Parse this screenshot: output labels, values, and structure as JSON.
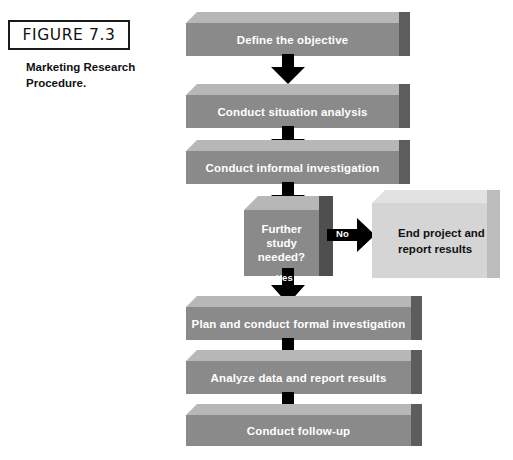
{
  "figure": {
    "label": "FIGURE 7.3",
    "caption": "Marketing Research Procedure."
  },
  "flowchart": {
    "title": "Marketing Research Procedure",
    "steps": [
      {
        "id": "step-1",
        "text": "Define the objective",
        "shape": "bar"
      },
      {
        "id": "step-2",
        "text": "Conduct situation analysis",
        "shape": "bar"
      },
      {
        "id": "step-3",
        "text": "Conduct informal investigation",
        "shape": "bar"
      },
      {
        "id": "step-4",
        "text": "Further study needed?",
        "shape": "decision"
      },
      {
        "id": "step-5",
        "text": "Plan and conduct formal investigation",
        "shape": "bar"
      },
      {
        "id": "step-6",
        "text": "Analyze data and report results",
        "shape": "bar"
      },
      {
        "id": "step-7",
        "text": "Conduct follow-up",
        "shape": "bar"
      }
    ],
    "decision": {
      "line1": "Further",
      "line2": "study",
      "line3": "needed?",
      "yes_label": "Yes",
      "no_label": "No"
    },
    "terminal": {
      "line1": "End project and",
      "line2": "report results"
    },
    "colors": {
      "bar_front": "#8a8a8a",
      "bar_top": "#b7b7b7",
      "bar_side": "#5d5d5d",
      "terminal_front": "#d5d5d5",
      "terminal_top": "#e2e2e2",
      "terminal_side": "#bcbcbc",
      "arrow": "#000000",
      "bar_text": "#ffffff",
      "terminal_text": "#111111",
      "background": "#ffffff"
    }
  }
}
